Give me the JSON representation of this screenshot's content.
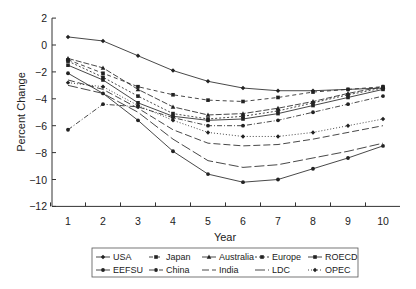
{
  "chart_data": {
    "type": "line",
    "title": "",
    "xlabel": "Year",
    "ylabel": "Percent Change",
    "x": [
      1,
      2,
      3,
      4,
      5,
      6,
      7,
      8,
      9,
      10
    ],
    "xticks": [
      "1",
      "2",
      "3",
      "4",
      "5",
      "6",
      "7",
      "8",
      "9",
      "10"
    ],
    "yticks": [
      "2",
      "0",
      "−2",
      "−4",
      "−6",
      "−8",
      "−10",
      "−12"
    ],
    "ylim": [
      -12,
      2
    ],
    "xlim": [
      1,
      10
    ],
    "grid": false,
    "legend_position": "bottom",
    "series": [
      {
        "name": "USA",
        "marker": "diamond",
        "dash": "",
        "values": [
          0.6,
          0.3,
          -0.8,
          -1.9,
          -2.7,
          -3.2,
          -3.4,
          -3.4,
          -3.3,
          -3.2
        ]
      },
      {
        "name": "Japan",
        "marker": "square",
        "dash": "4,3",
        "values": [
          -1.1,
          -2.1,
          -3.1,
          -3.7,
          -4.1,
          -4.2,
          -3.9,
          -3.5,
          -3.3,
          -3.1
        ]
      },
      {
        "name": "Australia",
        "marker": "triangle",
        "dash": "6,2",
        "values": [
          -1.0,
          -1.7,
          -3.3,
          -4.6,
          -5.2,
          -5.1,
          -4.7,
          -4.2,
          -3.6,
          -3.1
        ]
      },
      {
        "name": "Europe",
        "marker": "square",
        "dash": "2,2",
        "values": [
          -1.2,
          -2.4,
          -3.8,
          -5.1,
          -5.5,
          -5.3,
          -4.9,
          -4.3,
          -3.7,
          -3.2
        ]
      },
      {
        "name": "ROECD",
        "marker": "square",
        "dash": "",
        "values": [
          -1.5,
          -2.6,
          -4.3,
          -5.3,
          -5.6,
          -5.5,
          -5.1,
          -4.5,
          -3.9,
          -3.3
        ]
      },
      {
        "name": "EEFSU",
        "marker": "circle",
        "dash": "",
        "values": [
          -2.1,
          -3.6,
          -5.6,
          -7.9,
          -9.6,
          -10.2,
          -10.0,
          -9.2,
          -8.4,
          -7.5
        ]
      },
      {
        "name": "China",
        "marker": "circle",
        "dash": "5,2,1,2",
        "values": [
          -6.3,
          -4.4,
          -4.6,
          -5.4,
          -6.0,
          -6.0,
          -5.6,
          -5.0,
          -4.4,
          -3.8
        ]
      },
      {
        "name": "India",
        "marker": "none",
        "dash": "7,3",
        "values": [
          -2.6,
          -3.3,
          -4.7,
          -6.3,
          -7.3,
          -7.5,
          -7.4,
          -7.0,
          -6.5,
          -6.0
        ]
      },
      {
        "name": "LDC",
        "marker": "none",
        "dash": "10,3",
        "values": [
          -3.0,
          -3.6,
          -5.0,
          -7.0,
          -8.6,
          -9.1,
          -8.9,
          -8.4,
          -7.9,
          -7.3
        ]
      },
      {
        "name": "OPEC",
        "marker": "diamond",
        "dash": "1,2",
        "values": [
          -2.8,
          -3.1,
          -4.5,
          -5.6,
          -6.5,
          -6.8,
          -6.8,
          -6.5,
          -6.0,
          -5.5
        ]
      }
    ]
  }
}
